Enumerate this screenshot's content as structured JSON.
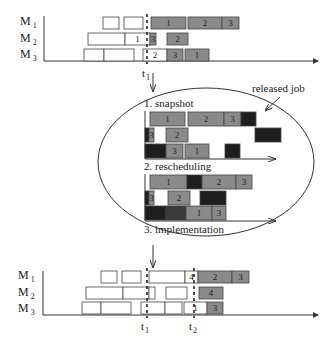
{
  "colors": {
    "background": "#ffffff",
    "line": "#333333",
    "box_stroke": "#444444",
    "done_fill": "#ffffff",
    "scheduled_fill": "#8a8a8a",
    "dark_fill": "#1e1e1e",
    "darkish_fill": "#3a3a3a"
  },
  "machines": [
    "M",
    "M",
    "M"
  ],
  "machine_subs": [
    "1",
    "2",
    "3"
  ],
  "top_chart": {
    "time_marker": "t",
    "time_marker_sub": "1",
    "rows": [
      [
        {
          "x": 103,
          "w": 16,
          "fill": "done",
          "label": ""
        },
        {
          "x": 124,
          "w": 19,
          "fill": "done",
          "label": ""
        },
        {
          "x": 151,
          "w": 35,
          "fill": "sched",
          "label": "1"
        },
        {
          "x": 188,
          "w": 34,
          "fill": "sched",
          "label": "2"
        },
        {
          "x": 222,
          "w": 17,
          "fill": "sched",
          "label": "3"
        }
      ],
      [
        {
          "x": 88,
          "w": 37,
          "fill": "done",
          "label": ""
        },
        {
          "x": 125,
          "w": 25,
          "fill": "done",
          "label": "1"
        },
        {
          "x": 150,
          "w": 6,
          "fill": "sched",
          "label": "3"
        },
        {
          "x": 167,
          "w": 21,
          "fill": "sched",
          "label": "2"
        }
      ],
      [
        {
          "x": 84,
          "w": 20,
          "fill": "done",
          "label": ""
        },
        {
          "x": 104,
          "w": 30,
          "fill": "done",
          "label": ""
        },
        {
          "x": 143,
          "w": 24,
          "fill": "done",
          "label": "2"
        },
        {
          "x": 167,
          "w": 16,
          "fill": "sched",
          "label": "3"
        },
        {
          "x": 185,
          "w": 24,
          "fill": "sched",
          "label": "1"
        }
      ]
    ]
  },
  "ellipse": {
    "released_job_label": "released job",
    "steps": [
      "1. snapshot",
      "2. rescheduling",
      "3. implementation"
    ],
    "snapshot_rows": [
      [
        {
          "x": 150,
          "w": 35,
          "fill": "sched",
          "label": "1"
        },
        {
          "x": 188,
          "w": 36,
          "fill": "sched",
          "label": "2"
        },
        {
          "x": 224,
          "w": 17,
          "fill": "sched",
          "label": "3"
        },
        {
          "x": 241,
          "w": 15,
          "fill": "dark",
          "label": ""
        }
      ],
      [
        {
          "x": 145,
          "w": 4,
          "fill": "dark",
          "label": ""
        },
        {
          "x": 149,
          "w": 5,
          "fill": "sched",
          "label": "3"
        },
        {
          "x": 166,
          "w": 22,
          "fill": "sched",
          "label": "2"
        },
        {
          "x": 255,
          "w": 26,
          "fill": "dark",
          "label": ""
        }
      ],
      [
        {
          "x": 145,
          "w": 21,
          "fill": "dark",
          "label": ""
        },
        {
          "x": 166,
          "w": 17,
          "fill": "sched",
          "label": "3"
        },
        {
          "x": 185,
          "w": 24,
          "fill": "sched",
          "label": "1"
        },
        {
          "x": 225,
          "w": 15,
          "fill": "dark",
          "label": ""
        }
      ]
    ],
    "rescheduling_rows": [
      [
        {
          "x": 150,
          "w": 37,
          "fill": "sched",
          "label": "1"
        },
        {
          "x": 187,
          "w": 15,
          "fill": "dark",
          "label": ""
        },
        {
          "x": 202,
          "w": 34,
          "fill": "sched",
          "label": "2"
        },
        {
          "x": 236,
          "w": 16,
          "fill": "sched",
          "label": "3"
        }
      ],
      [
        {
          "x": 145,
          "w": 4,
          "fill": "dark",
          "label": ""
        },
        {
          "x": 149,
          "w": 5,
          "fill": "sched",
          "label": "3"
        },
        {
          "x": 168,
          "w": 22,
          "fill": "sched",
          "label": "2"
        },
        {
          "x": 200,
          "w": 26,
          "fill": "dark",
          "label": ""
        }
      ],
      [
        {
          "x": 145,
          "w": 21,
          "fill": "dark",
          "label": ""
        },
        {
          "x": 166,
          "w": 20,
          "fill": "darkish",
          "label": ""
        },
        {
          "x": 186,
          "w": 26,
          "fill": "sched",
          "label": "1"
        },
        {
          "x": 212,
          "w": 14,
          "fill": "sched",
          "label": "3"
        }
      ]
    ]
  },
  "bottom_chart": {
    "time_markers": [
      {
        "t": "t",
        "sub": "1",
        "x": 147
      },
      {
        "t": "t",
        "sub": "2",
        "x": 194
      }
    ],
    "rows": [
      [
        {
          "x": 101,
          "w": 16,
          "fill": "done",
          "label": ""
        },
        {
          "x": 122,
          "w": 19,
          "fill": "done",
          "label": ""
        },
        {
          "x": 149,
          "w": 36,
          "fill": "done",
          "label": ""
        },
        {
          "x": 185,
          "w": 13,
          "fill": "done",
          "label": "4"
        },
        {
          "x": 198,
          "w": 34,
          "fill": "sched",
          "label": "2"
        },
        {
          "x": 232,
          "w": 17,
          "fill": "sched",
          "label": "3"
        }
      ],
      [
        {
          "x": 86,
          "w": 37,
          "fill": "done",
          "label": ""
        },
        {
          "x": 123,
          "w": 26,
          "fill": "done",
          "label": ""
        },
        {
          "x": 149,
          "w": 6,
          "fill": "done",
          "label": ""
        },
        {
          "x": 166,
          "w": 21,
          "fill": "done",
          "label": ""
        },
        {
          "x": 199,
          "w": 24,
          "fill": "sched",
          "label": "4"
        }
      ],
      [
        {
          "x": 82,
          "w": 19,
          "fill": "done",
          "label": ""
        },
        {
          "x": 101,
          "w": 30,
          "fill": "done",
          "label": ""
        },
        {
          "x": 141,
          "w": 24,
          "fill": "done",
          "label": ""
        },
        {
          "x": 165,
          "w": 17,
          "fill": "done",
          "label": ""
        },
        {
          "x": 184,
          "w": 23,
          "fill": "done",
          "label": "1"
        },
        {
          "x": 207,
          "w": 16,
          "fill": "sched",
          "label": "3"
        }
      ]
    ]
  }
}
